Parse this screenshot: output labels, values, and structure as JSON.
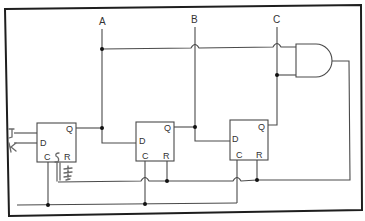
{
  "diagram": {
    "type": "digital-logic-circuit",
    "outputs": {
      "a_label": "A",
      "b_label": "B",
      "c_label": "C"
    },
    "flip_flops": [
      {
        "id": "ff1",
        "d_label": "D",
        "q_label": "Q",
        "c_label": "C",
        "r_label": "R"
      },
      {
        "id": "ff2",
        "d_label": "D",
        "q_label": "Q",
        "c_label": "C",
        "r_label": "R"
      },
      {
        "id": "ff3",
        "d_label": "D",
        "q_label": "Q",
        "c_label": "C",
        "r_label": "R"
      }
    ],
    "gates": [
      {
        "id": "and1",
        "type": "AND",
        "inputs": [
          "A",
          "C"
        ],
        "output": "reset"
      }
    ],
    "handwritten": {
      "j_mark": "J",
      "k_mark": "K",
      "s_mark": "S",
      "scribble": "ground-like scribble"
    },
    "colors": {
      "wire": "#4a4a4a",
      "frame": "#1e1e1e",
      "junction": "#111111",
      "pencil": "#6b6b6b"
    }
  }
}
